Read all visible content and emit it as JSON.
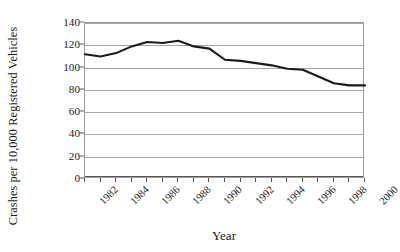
{
  "chart_data": {
    "type": "line",
    "title": "",
    "xlabel": "Year",
    "ylabel": "Crashes per 10,000 Registered Vehicles",
    "x": [
      1982,
      1983,
      1984,
      1985,
      1986,
      1987,
      1988,
      1989,
      1990,
      1991,
      1992,
      1993,
      1994,
      1995,
      1996,
      1997,
      1998,
      1999,
      2000
    ],
    "values": [
      112,
      110,
      113,
      119,
      123,
      122,
      124,
      119,
      117,
      107,
      106,
      104,
      102,
      99,
      98,
      92,
      86,
      84,
      84
    ],
    "series": [
      {
        "name": "Crashes per 10,000 Registered Vehicles",
        "values": [
          112,
          110,
          113,
          119,
          123,
          122,
          124,
          119,
          117,
          107,
          106,
          104,
          102,
          99,
          98,
          92,
          86,
          84,
          84
        ]
      }
    ],
    "xlim": [
      1982,
      2000
    ],
    "ylim": [
      0,
      140
    ],
    "ytick_labels": [
      "140",
      "120",
      "100",
      "80",
      "60",
      "40",
      "20",
      "0"
    ],
    "ytick_values": [
      140,
      120,
      100,
      80,
      60,
      40,
      20,
      0
    ],
    "xtick_labels": [
      "1982",
      "1984",
      "1986",
      "1988",
      "1990",
      "1992",
      "1994",
      "1996",
      "1998",
      "2000"
    ],
    "xtick_values": [
      1982,
      1984,
      1986,
      1988,
      1990,
      1992,
      1994,
      1996,
      1998,
      2000
    ],
    "grid": true,
    "grid_axis": "y",
    "legend": false,
    "legend_position": "none",
    "line_color": "#1a1a1a",
    "grid_color": "#a6a6a6",
    "frame_color": "#9a9a9a",
    "background": "#ffffff"
  }
}
